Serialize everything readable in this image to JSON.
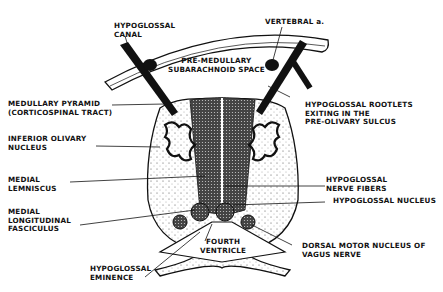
{
  "diagram": {
    "labels": {
      "hypoglossal_canal": "HYPOGLOSSAL\nCANAL",
      "vertebral_artery": "VERTEBRAL a.",
      "premedullary_space": "PRE-MEDULLARY\nSUBARACHNOID SPACE",
      "medullary_pyramid": "MEDULLARY PYRAMID\n(CORTICOSPINAL TRACT)",
      "hypoglossal_rootlets": "HYPOGLOSSAL ROOTLETS\nEXITING IN THE\nPRE-OLIVARY SULCUS",
      "inferior_olivary": "INFERIOR OLIVARY\nNUCLEUS",
      "medial_lemniscus": "MEDIAL\nLEMNISCUS",
      "hypoglossal_fibers": "HYPOGLOSSAL\nNERVE FIBERS",
      "hypoglossal_nucleus": "HYPOGLOSSAL NUCLEUS",
      "mlf": "MEDIAL\nLONGITUDINAL\nFASCICULUS",
      "fourth_ventricle": "FOURTH\nVENTRICLE",
      "dorsal_motor": "DORSAL MOTOR NUCLEUS OF\nVAGUS NERVE",
      "hypoglossal_eminence": "HYPOGLOSSAL\nEMINENCE"
    }
  }
}
